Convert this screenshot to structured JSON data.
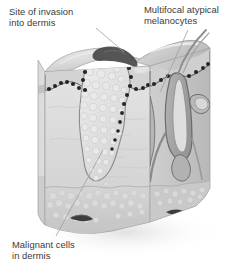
{
  "figure": {
    "kind": "medical-illustration",
    "view": "three-dimensional cut-away block of skin",
    "palette": {
      "background": "#ffffff",
      "text": "#3b3b3b",
      "leader_line": "#9a9a9a",
      "top_surface_light": "#e8e8e8",
      "top_surface_mid": "#c9c9c9",
      "epidermis_band": "#d0d0d0",
      "epidermis_outline": "#6e6e6e",
      "dermis_fill": "#d9d9d9",
      "dermis_side": "#c2c2c2",
      "subcutis_fill": "#cfcfcf",
      "tumor_nest": "#e3e3e3",
      "tumor_outline": "#8a8a8a",
      "melanocyte_dot": "#2b2b2b",
      "invasion_dark": "#3a3a3a",
      "follicle_fill": "#a8a8a8",
      "follicle_outline": "#6b6b6b",
      "vessel_dark": "#4a4a4a",
      "hair_shaft": "#8f8f8f"
    }
  },
  "labels": {
    "invasion": {
      "line1": "Site of invasion",
      "line2": "into dermis",
      "leader": {
        "x1": 96,
        "y1": 28,
        "x2": 124,
        "y2": 52
      }
    },
    "melanocytes": {
      "line1": "Multifocal atypical",
      "line2": "melanocytes",
      "leader": {
        "x1": 188,
        "y1": 30,
        "x2": 160,
        "y2": 92
      }
    },
    "malignant": {
      "line1": "Malignant cells",
      "line2": "in dermis",
      "leader": {
        "x1": 56,
        "y1": 236,
        "x2": 103,
        "y2": 150
      }
    }
  },
  "anatomy": {
    "layers": [
      {
        "name": "epidermis",
        "role": "outer keratinized layer, thin dark-edged band"
      },
      {
        "name": "dermis",
        "role": "thick pale middle layer"
      },
      {
        "name": "subcutis",
        "role": "fatty base layer with vessels"
      }
    ],
    "features": [
      {
        "name": "tumor-nest",
        "role": "bubbly pale nodule invading dermis"
      },
      {
        "name": "melanocyte-dots",
        "role": "dark dots along dermal-epidermal junction"
      },
      {
        "name": "hair-follicle",
        "role": "follicle on right face with hair shaft"
      },
      {
        "name": "blood-vessels",
        "role": "dark elongated vessels in subcutis"
      }
    ]
  }
}
